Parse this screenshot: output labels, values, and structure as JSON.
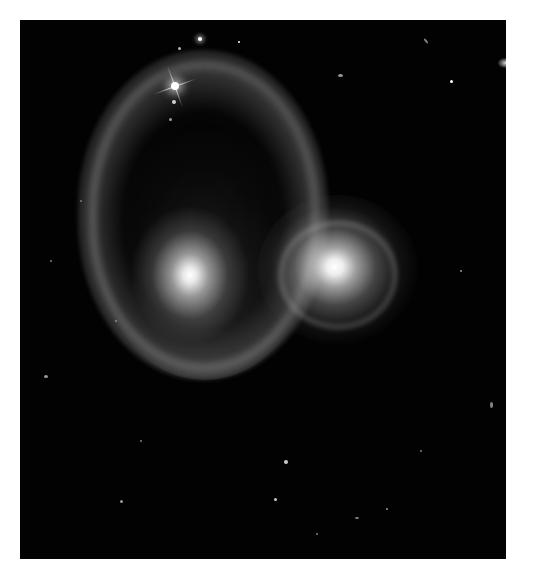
{
  "image": {
    "subject": "interacting galaxy pair resembling a ghostly face",
    "description": "Black-and-white deep-space photograph of two colliding galaxies forming a glowing ring with two bright cores, surrounded by scattered stars and a bright diffraction-spiked star in the upper left",
    "colors": {
      "background": "#ffffff",
      "space": "#020202",
      "glow": "#e8e8e8"
    }
  }
}
